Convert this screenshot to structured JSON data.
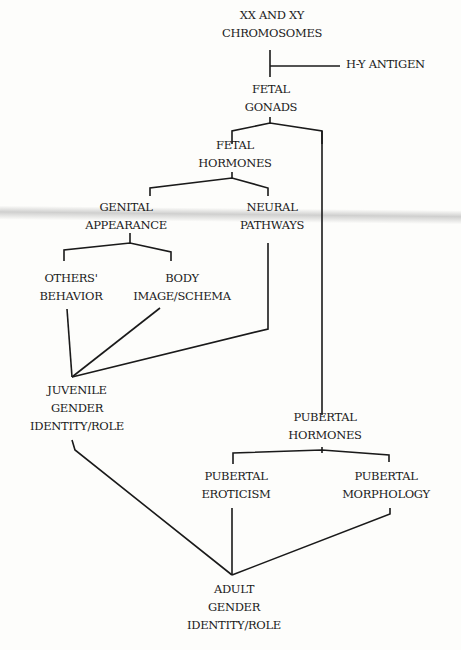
{
  "diagram": {
    "nodes": {
      "chromosomes": [
        "XX AND XY",
        "CHROMOSOMES"
      ],
      "hy_antigen": "H-Y ANTIGEN",
      "fetal_gonads": [
        "FETAL",
        "GONADS"
      ],
      "fetal_hormones": [
        "FETAL",
        "HORMONES"
      ],
      "genital_appearance": [
        "GENITAL",
        "APPEARANCE"
      ],
      "neural_pathways": [
        "NEURAL",
        "PATHWAYS"
      ],
      "others_behavior": [
        "OTHERS'",
        "BEHAVIOR"
      ],
      "body_image": [
        "BODY",
        "IMAGE/SCHEMA"
      ],
      "juvenile_gender": [
        "JUVENILE",
        "GENDER",
        "IDENTITY/ROLE"
      ],
      "pubertal_hormones": [
        "PUBERTAL",
        "HORMONES"
      ],
      "pubertal_eroticism": [
        "PUBERTAL",
        "EROTICISM"
      ],
      "pubertal_morphology": [
        "PUBERTAL",
        "MORPHOLOGY"
      ],
      "adult_gender": [
        "ADULT",
        "GENDER",
        "IDENTITY/ROLE"
      ]
    },
    "edges": [
      [
        "chromosomes",
        "fetal_gonads"
      ],
      [
        "hy_antigen",
        "fetal_gonads"
      ],
      [
        "fetal_gonads",
        "fetal_hormones"
      ],
      [
        "fetal_gonads",
        "pubertal_hormones"
      ],
      [
        "fetal_hormones",
        "genital_appearance"
      ],
      [
        "fetal_hormones",
        "neural_pathways"
      ],
      [
        "genital_appearance",
        "others_behavior"
      ],
      [
        "genital_appearance",
        "body_image"
      ],
      [
        "others_behavior",
        "juvenile_gender"
      ],
      [
        "body_image",
        "juvenile_gender"
      ],
      [
        "neural_pathways",
        "juvenile_gender"
      ],
      [
        "pubertal_hormones",
        "pubertal_eroticism"
      ],
      [
        "pubertal_hormones",
        "pubertal_morphology"
      ],
      [
        "juvenile_gender",
        "adult_gender"
      ],
      [
        "pubertal_eroticism",
        "adult_gender"
      ],
      [
        "pubertal_morphology",
        "adult_gender"
      ]
    ],
    "colors": {
      "ink": "#1a1a1a",
      "paper": "#fdfdfb"
    }
  }
}
